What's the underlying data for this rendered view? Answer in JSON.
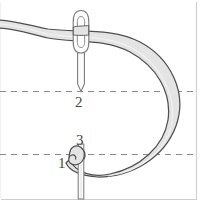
{
  "figure": {
    "background_color": "#ffffff",
    "width": 210,
    "height": 218,
    "labels": [
      {
        "id": "label-1",
        "text": "1",
        "x": 58,
        "y": 156
      },
      {
        "id": "label-2",
        "text": "2",
        "x": 75,
        "y": 95
      },
      {
        "id": "label-3",
        "text": "3",
        "x": 76,
        "y": 133
      }
    ],
    "caption": {
      "text": "clipped caption line",
      "visible": false
    },
    "guides": {
      "dashed_line_upper_y": 91,
      "dashed_line_lower_y": 154,
      "dash_color": "#808080",
      "frame_right_x": 196,
      "frame_bottom_y": 199,
      "frame_color": "#c8c8c8"
    },
    "thread": {
      "fill_color": "#e2e2e2",
      "stroke_color": "#4d4d4d",
      "description": "loop of thread entering from left, passing through needle eye, curving right and down, ending in a small hook at point 1"
    },
    "needle": {
      "stroke_color": "#7a7a7a",
      "fill_color": "#fbfbfb",
      "eye_center_x": 81,
      "eye_top_y": 11,
      "tip_y": 91,
      "lower_shaft_x": 81,
      "lower_shaft_top_y": 144,
      "lower_shaft_bottom_y": 199
    }
  }
}
